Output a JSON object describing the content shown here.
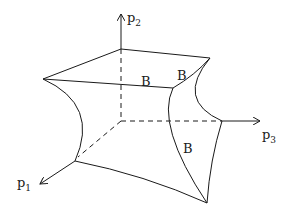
{
  "diagram": {
    "axes": [
      {
        "id": "p1",
        "label": "p",
        "subscript": "1"
      },
      {
        "id": "p2",
        "label": "p",
        "subscript": "2"
      },
      {
        "id": "p3",
        "label": "p",
        "subscript": "3"
      }
    ],
    "boundary_labels": [
      {
        "id": "b-top-front",
        "text": "B"
      },
      {
        "id": "b-top-right",
        "text": "B"
      },
      {
        "id": "b-right-face",
        "text": "B"
      }
    ],
    "colors": {
      "stroke": "#1a1a1a",
      "background": "#ffffff"
    }
  }
}
